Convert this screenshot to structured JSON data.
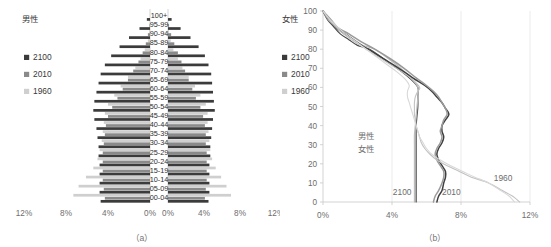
{
  "figure": {
    "captions": {
      "a": "（a）",
      "b": "（b）"
    }
  },
  "panel_a": {
    "legend_left": {
      "title": "男性",
      "items": [
        {
          "label": "2100",
          "color": "#3b3b3b"
        },
        {
          "label": "2010",
          "color": "#8a8a8a"
        },
        {
          "label": "1960",
          "color": "#cfcfcf"
        }
      ]
    },
    "legend_right": {
      "title": "女性",
      "items": [
        {
          "label": "2100",
          "color": "#3b3b3b"
        },
        {
          "label": "2010",
          "color": "#8a8a8a"
        },
        {
          "label": "1960",
          "color": "#cfcfcf"
        }
      ]
    },
    "x_ticks_left": [
      "12%",
      "8%",
      "4%",
      "0%"
    ],
    "x_ticks_right": [
      "0%",
      "4%",
      "8%",
      "12%"
    ]
  },
  "panel_b": {
    "y_ticks": [
      "0",
      "10",
      "20",
      "30",
      "40",
      "50",
      "60",
      "70",
      "80",
      "90",
      "100"
    ],
    "x_ticks": [
      "0%",
      "4%",
      "8%",
      "12%"
    ],
    "inline_labels": [
      {
        "text": "男性",
        "color": "#4a4a4a"
      },
      {
        "text": "女性",
        "color": "#b4b4b4"
      }
    ],
    "curve_labels": [
      {
        "text": "2100",
        "color": "#6d6d6d"
      },
      {
        "text": "2010",
        "color": "#6d6d6d"
      },
      {
        "text": "1960",
        "color": "#6d6d6d"
      }
    ]
  },
  "chart_data": [
    {
      "type": "bar",
      "subtype": "population-pyramid",
      "title": "（a）",
      "xlabel": "",
      "ylabel": "",
      "xlim": [
        0,
        12
      ],
      "xunit": "%",
      "categories": [
        "00-04",
        "05-09",
        "10-14",
        "15-19",
        "20-24",
        "25-29",
        "30-34",
        "35-39",
        "40-44",
        "45-49",
        "50-54",
        "55-59",
        "60-64",
        "65-69",
        "70-74",
        "75-79",
        "80-84",
        "85-89",
        "90-94",
        "95-99",
        "100+"
      ],
      "grid": false,
      "legend_position": "left-and-right-outside",
      "series": [
        {
          "name": "2100",
          "sex": "男性",
          "side": "left",
          "color": "#3b3b3b",
          "values": [
            4.7,
            4.8,
            4.8,
            4.8,
            4.8,
            4.9,
            4.9,
            5.0,
            5.1,
            5.3,
            5.4,
            5.3,
            5.1,
            4.9,
            4.7,
            4.3,
            3.7,
            2.9,
            2.0,
            1.0,
            0.3
          ]
        },
        {
          "name": "2010",
          "sex": "男性",
          "side": "left",
          "color": "#8a8a8a",
          "values": [
            4.3,
            4.4,
            4.5,
            4.5,
            4.5,
            4.5,
            4.4,
            4.3,
            4.2,
            4.0,
            3.6,
            3.1,
            2.6,
            2.1,
            1.6,
            1.1,
            0.7,
            0.4,
            0.2,
            0.05,
            0.01
          ]
        },
        {
          "name": "1960",
          "sex": "男性",
          "side": "left",
          "color": "#cfcfcf",
          "values": [
            7.3,
            6.8,
            6.1,
            5.4,
            5.0,
            4.8,
            4.6,
            4.5,
            4.4,
            4.3,
            4.0,
            3.4,
            2.8,
            2.1,
            1.4,
            0.9,
            0.5,
            0.2,
            0.06,
            0.01,
            0.0
          ]
        },
        {
          "name": "2100",
          "sex": "女性",
          "side": "right",
          "color": "#3b3b3b",
          "values": [
            4.5,
            4.6,
            4.6,
            4.6,
            4.6,
            4.7,
            4.7,
            4.8,
            4.9,
            5.0,
            5.2,
            5.1,
            5.0,
            4.9,
            4.8,
            4.5,
            4.1,
            3.4,
            2.5,
            1.4,
            0.4
          ]
        },
        {
          "name": "2010",
          "sex": "女性",
          "side": "right",
          "color": "#8a8a8a",
          "values": [
            4.1,
            4.2,
            4.3,
            4.3,
            4.3,
            4.3,
            4.2,
            4.2,
            4.1,
            3.9,
            3.6,
            3.1,
            2.7,
            2.3,
            1.9,
            1.5,
            1.1,
            0.7,
            0.35,
            0.12,
            0.02
          ]
        },
        {
          "name": "1960",
          "sex": "女性",
          "side": "right",
          "color": "#cfcfcf",
          "values": [
            7.0,
            6.5,
            5.9,
            5.3,
            4.9,
            4.7,
            4.6,
            4.5,
            4.4,
            4.4,
            4.2,
            3.6,
            3.0,
            2.3,
            1.6,
            1.1,
            0.6,
            0.3,
            0.09,
            0.02,
            0.0
          ]
        }
      ]
    },
    {
      "type": "line",
      "title": "（b）",
      "xlabel": "",
      "ylabel": "",
      "xlim": [
        0,
        12
      ],
      "ylim": [
        0,
        100
      ],
      "xunit": "%",
      "grid": true,
      "legend_position": "inline-annotations",
      "series": [
        {
          "name": "2100",
          "sex": "男性",
          "color": "#4a4a4a",
          "points": [
            [
              5.4,
              0
            ],
            [
              5.4,
              5
            ],
            [
              5.4,
              10
            ],
            [
              5.4,
              15
            ],
            [
              5.4,
              20
            ],
            [
              5.4,
              25
            ],
            [
              5.4,
              30
            ],
            [
              5.4,
              35
            ],
            [
              5.4,
              40
            ],
            [
              5.45,
              45
            ],
            [
              5.5,
              50
            ],
            [
              5.5,
              55
            ],
            [
              5.5,
              60
            ],
            [
              5.0,
              65
            ],
            [
              4.3,
              70
            ],
            [
              3.5,
              75
            ],
            [
              2.7,
              80
            ],
            [
              2.0,
              82
            ],
            [
              1.5,
              85
            ],
            [
              1.0,
              88
            ],
            [
              0.6,
              92
            ],
            [
              0.3,
              95
            ],
            [
              0.1,
              98
            ],
            [
              0.0,
              100
            ]
          ]
        },
        {
          "name": "2100",
          "sex": "女性",
          "color": "#bdbdbd",
          "points": [
            [
              5.3,
              0
            ],
            [
              5.3,
              5
            ],
            [
              5.3,
              10
            ],
            [
              5.3,
              15
            ],
            [
              5.3,
              20
            ],
            [
              5.3,
              25
            ],
            [
              5.3,
              30
            ],
            [
              5.3,
              35
            ],
            [
              5.35,
              40
            ],
            [
              5.4,
              45
            ],
            [
              5.45,
              50
            ],
            [
              5.5,
              55
            ],
            [
              5.5,
              60
            ],
            [
              5.1,
              65
            ],
            [
              4.5,
              70
            ],
            [
              3.8,
              75
            ],
            [
              3.0,
              80
            ],
            [
              2.3,
              82
            ],
            [
              1.8,
              85
            ],
            [
              1.2,
              88
            ],
            [
              0.7,
              92
            ],
            [
              0.35,
              95
            ],
            [
              0.12,
              98
            ],
            [
              0.0,
              100
            ]
          ]
        },
        {
          "name": "2010",
          "sex": "男性",
          "color": "#3f3f3f",
          "points": [
            [
              6.6,
              0
            ],
            [
              6.7,
              3
            ],
            [
              6.9,
              6
            ],
            [
              7.0,
              10
            ],
            [
              7.1,
              13
            ],
            [
              7.1,
              16
            ],
            [
              6.9,
              19
            ],
            [
              6.7,
              22
            ],
            [
              6.6,
              25
            ],
            [
              6.7,
              28
            ],
            [
              6.9,
              31
            ],
            [
              7.0,
              34
            ],
            [
              6.9,
              37
            ],
            [
              6.9,
              40
            ],
            [
              7.1,
              43
            ],
            [
              7.3,
              46
            ],
            [
              7.1,
              49
            ],
            [
              6.9,
              52
            ],
            [
              6.6,
              55
            ],
            [
              6.3,
              58
            ],
            [
              5.9,
              61
            ],
            [
              5.2,
              65
            ],
            [
              4.4,
              70
            ],
            [
              3.5,
              75
            ],
            [
              2.6,
              80
            ],
            [
              1.9,
              84
            ],
            [
              1.3,
              88
            ],
            [
              0.8,
              91
            ],
            [
              0.4,
              95
            ],
            [
              0.15,
              98
            ],
            [
              0.0,
              100
            ]
          ]
        },
        {
          "name": "2010",
          "sex": "女性",
          "color": "#9a9a9a",
          "points": [
            [
              6.4,
              0
            ],
            [
              6.5,
              3
            ],
            [
              6.7,
              6
            ],
            [
              6.9,
              10
            ],
            [
              7.0,
              13
            ],
            [
              7.0,
              16
            ],
            [
              6.8,
              19
            ],
            [
              6.6,
              22
            ],
            [
              6.5,
              25
            ],
            [
              6.6,
              28
            ],
            [
              6.8,
              31
            ],
            [
              6.9,
              34
            ],
            [
              6.8,
              37
            ],
            [
              6.9,
              40
            ],
            [
              7.0,
              43
            ],
            [
              7.2,
              46
            ],
            [
              7.1,
              49
            ],
            [
              6.9,
              52
            ],
            [
              6.7,
              55
            ],
            [
              6.4,
              58
            ],
            [
              6.0,
              61
            ],
            [
              5.4,
              65
            ],
            [
              4.7,
              70
            ],
            [
              3.9,
              75
            ],
            [
              3.0,
              80
            ],
            [
              2.2,
              84
            ],
            [
              1.5,
              88
            ],
            [
              0.9,
              91
            ],
            [
              0.5,
              95
            ],
            [
              0.2,
              98
            ],
            [
              0.0,
              100
            ]
          ]
        },
        {
          "name": "1960",
          "sex": "男性",
          "color": "#c2c2c2",
          "points": [
            [
              11.4,
              0
            ],
            [
              11.0,
              3
            ],
            [
              10.4,
              6
            ],
            [
              9.6,
              10
            ],
            [
              8.6,
              13
            ],
            [
              7.9,
              16
            ],
            [
              7.2,
              19
            ],
            [
              6.6,
              22
            ],
            [
              6.2,
              25
            ],
            [
              5.9,
              28
            ],
            [
              5.7,
              31
            ],
            [
              5.6,
              34
            ],
            [
              5.5,
              37
            ],
            [
              5.4,
              40
            ],
            [
              5.35,
              43
            ],
            [
              5.3,
              46
            ],
            [
              5.3,
              49
            ],
            [
              5.3,
              52
            ],
            [
              5.35,
              55
            ],
            [
              5.5,
              58
            ],
            [
              5.6,
              60
            ],
            [
              5.2,
              64
            ],
            [
              4.6,
              68
            ],
            [
              3.9,
              72
            ],
            [
              3.2,
              76
            ],
            [
              2.5,
              80
            ],
            [
              1.8,
              84
            ],
            [
              1.2,
              88
            ],
            [
              0.7,
              92
            ],
            [
              0.3,
              96
            ],
            [
              0.0,
              100
            ]
          ]
        },
        {
          "name": "1960",
          "sex": "女性",
          "color": "#d8d8d8",
          "points": [
            [
              11.1,
              0
            ],
            [
              10.8,
              3
            ],
            [
              10.3,
              6
            ],
            [
              9.6,
              10
            ],
            [
              8.8,
              13
            ],
            [
              8.1,
              16
            ],
            [
              7.4,
              19
            ],
            [
              6.8,
              22
            ],
            [
              6.3,
              25
            ],
            [
              6.0,
              28
            ],
            [
              5.8,
              31
            ],
            [
              5.6,
              34
            ],
            [
              5.5,
              37
            ],
            [
              5.4,
              40
            ],
            [
              5.3,
              43
            ],
            [
              5.2,
              46
            ],
            [
              5.1,
              49
            ],
            [
              5.0,
              52
            ],
            [
              4.9,
              55
            ],
            [
              4.9,
              58
            ],
            [
              5.0,
              61
            ],
            [
              4.8,
              64
            ],
            [
              4.3,
              68
            ],
            [
              3.7,
              72
            ],
            [
              3.1,
              76
            ],
            [
              2.5,
              80
            ],
            [
              1.9,
              84
            ],
            [
              1.3,
              88
            ],
            [
              0.8,
              92
            ],
            [
              0.35,
              96
            ],
            [
              0.0,
              100
            ]
          ]
        }
      ]
    }
  ]
}
